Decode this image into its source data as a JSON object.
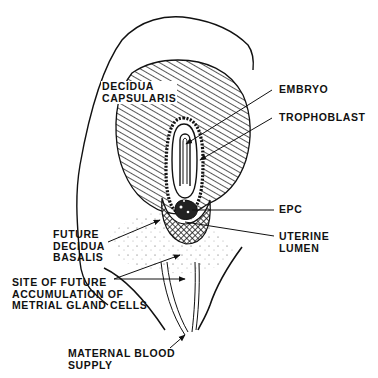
{
  "diagram": {
    "type": "anatomical-illustration",
    "colors": {
      "ink": "#111111",
      "background": "#ffffff"
    },
    "labels": {
      "decidua_capsularis": {
        "line1": "DECIDUA",
        "line2": "CAPSULARIS"
      },
      "embryo": "EMBRYO",
      "trophoblast": "TROPHOBLAST",
      "epc": "EPC",
      "uterine_lumen": {
        "line1": "UTERINE",
        "line2": "LUMEN"
      },
      "future_decidua_basalis": {
        "line1": "FUTURE",
        "line2": "DECIDUA",
        "line3": "BASALIS"
      },
      "site_of_future_accumulation": {
        "line1": "SITE OF FUTURE",
        "line2": "ACCUMULATION OF",
        "line3": "METRIAL GLAND CELLS"
      },
      "maternal_blood_supply": {
        "line1": "MATERNAL BLOOD",
        "line2": "SUPPLY"
      }
    }
  }
}
